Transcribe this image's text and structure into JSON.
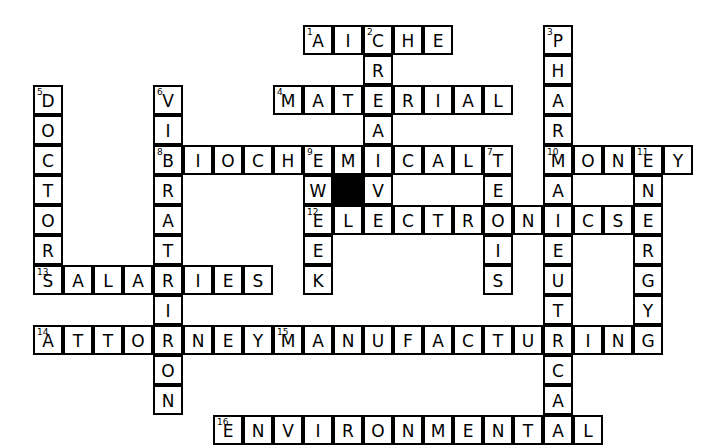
{
  "puzzle": {
    "title": "Crossword Puzzle",
    "cell_size": 30,
    "origin_x": 33,
    "origin_y": 25,
    "grid_cols": 22,
    "grid_rows": 14,
    "colors": {
      "background": "#ffffff",
      "cell_fill": "#ffffff",
      "cell_border": "#000000",
      "block_fill": "#000000",
      "letter": "#000000"
    },
    "entries": [
      {
        "number": "1",
        "direction": "across",
        "answer": "AICHE",
        "row": 0,
        "col": 9
      },
      {
        "number": "2",
        "direction": "down",
        "answer": "CREATE",
        "row": 0,
        "col": 11
      },
      {
        "number": "3",
        "direction": "down",
        "answer": "PHARMACEUTICAL",
        "row": 0,
        "col": 17
      },
      {
        "number": "4",
        "direction": "across",
        "answer": "MATERIAL",
        "row": 2,
        "col": 8
      },
      {
        "number": "5",
        "direction": "down",
        "answer": "DOCTOR",
        "row": 2,
        "col": 0
      },
      {
        "number": "6",
        "direction": "down",
        "answer": "VIBRATIONS",
        "row": 2,
        "col": 4
      },
      {
        "number": "7",
        "direction": "down",
        "answer": "TENSIS",
        "row": 4,
        "col": 15
      },
      {
        "number": "8",
        "direction": "across",
        "answer": "BIOCHEMICAL",
        "row": 4,
        "col": 4
      },
      {
        "number": "9",
        "direction": "down",
        "answer": "EWEEK",
        "row": 4,
        "col": 9
      },
      {
        "number": "10",
        "direction": "across",
        "answer": "MONEY",
        "row": 4,
        "col": 17
      },
      {
        "number": "11",
        "direction": "down",
        "answer": "ENERGY",
        "row": 4,
        "col": 20
      },
      {
        "number": "12",
        "direction": "across",
        "answer": "ELECTRONICS",
        "row": 6,
        "col": 9
      },
      {
        "number": "13",
        "direction": "across",
        "answer": "SALARIES",
        "row": 8,
        "col": 0
      },
      {
        "number": "14",
        "direction": "across",
        "answer": "ATTORNEY",
        "row": 10,
        "col": 0
      },
      {
        "number": "15",
        "direction": "across",
        "answer": "MANUFACTURING",
        "row": 10,
        "col": 8
      },
      {
        "number": "16",
        "direction": "across",
        "answer": "ENVIRONMENTAL",
        "row": 13,
        "col": 6
      }
    ],
    "blocks": [
      {
        "row": 5,
        "col": 10
      }
    ],
    "cells": [
      {
        "row": 0,
        "col": 9,
        "letter": "A",
        "number": "1"
      },
      {
        "row": 0,
        "col": 10,
        "letter": "I",
        "number": ""
      },
      {
        "row": 0,
        "col": 11,
        "letter": "C",
        "number": "2"
      },
      {
        "row": 0,
        "col": 12,
        "letter": "H",
        "number": ""
      },
      {
        "row": 0,
        "col": 13,
        "letter": "E",
        "number": ""
      },
      {
        "row": 0,
        "col": 17,
        "letter": "P",
        "number": "3"
      },
      {
        "row": 1,
        "col": 11,
        "letter": "R",
        "number": ""
      },
      {
        "row": 1,
        "col": 17,
        "letter": "H",
        "number": ""
      },
      {
        "row": 2,
        "col": 0,
        "letter": "D",
        "number": "5"
      },
      {
        "row": 2,
        "col": 4,
        "letter": "V",
        "number": "6"
      },
      {
        "row": 2,
        "col": 8,
        "letter": "M",
        "number": "4"
      },
      {
        "row": 2,
        "col": 9,
        "letter": "A",
        "number": ""
      },
      {
        "row": 2,
        "col": 10,
        "letter": "T",
        "number": ""
      },
      {
        "row": 2,
        "col": 11,
        "letter": "E",
        "number": ""
      },
      {
        "row": 2,
        "col": 12,
        "letter": "R",
        "number": ""
      },
      {
        "row": 2,
        "col": 13,
        "letter": "I",
        "number": ""
      },
      {
        "row": 2,
        "col": 14,
        "letter": "A",
        "number": ""
      },
      {
        "row": 2,
        "col": 15,
        "letter": "L",
        "number": ""
      },
      {
        "row": 2,
        "col": 17,
        "letter": "A",
        "number": ""
      },
      {
        "row": 3,
        "col": 0,
        "letter": "O",
        "number": ""
      },
      {
        "row": 3,
        "col": 4,
        "letter": "I",
        "number": ""
      },
      {
        "row": 3,
        "col": 11,
        "letter": "A",
        "number": ""
      },
      {
        "row": 3,
        "col": 17,
        "letter": "R",
        "number": ""
      },
      {
        "row": 4,
        "col": 0,
        "letter": "C",
        "number": ""
      },
      {
        "row": 4,
        "col": 4,
        "letter": "B",
        "number": "8"
      },
      {
        "row": 4,
        "col": 5,
        "letter": "I",
        "number": ""
      },
      {
        "row": 4,
        "col": 6,
        "letter": "O",
        "number": ""
      },
      {
        "row": 4,
        "col": 7,
        "letter": "C",
        "number": ""
      },
      {
        "row": 4,
        "col": 8,
        "letter": "H",
        "number": ""
      },
      {
        "row": 4,
        "col": 9,
        "letter": "E",
        "number": "9"
      },
      {
        "row": 4,
        "col": 10,
        "letter": "M",
        "number": ""
      },
      {
        "row": 4,
        "col": 11,
        "letter": "I",
        "number": ""
      },
      {
        "row": 4,
        "col": 12,
        "letter": "C",
        "number": ""
      },
      {
        "row": 4,
        "col": 13,
        "letter": "A",
        "number": ""
      },
      {
        "row": 4,
        "col": 14,
        "letter": "L",
        "number": ""
      },
      {
        "row": 4,
        "col": 15,
        "letter": "T",
        "number": "7"
      },
      {
        "row": 4,
        "col": 17,
        "letter": "M",
        "number": "10"
      },
      {
        "row": 4,
        "col": 18,
        "letter": "O",
        "number": ""
      },
      {
        "row": 4,
        "col": 19,
        "letter": "N",
        "number": ""
      },
      {
        "row": 4,
        "col": 20,
        "letter": "E",
        "number": "11"
      },
      {
        "row": 4,
        "col": 21,
        "letter": "Y",
        "number": ""
      },
      {
        "row": 5,
        "col": 0,
        "letter": "T",
        "number": ""
      },
      {
        "row": 5,
        "col": 4,
        "letter": "R",
        "number": ""
      },
      {
        "row": 5,
        "col": 9,
        "letter": "W",
        "number": ""
      },
      {
        "row": 5,
        "col": 11,
        "letter": "V",
        "number": ""
      },
      {
        "row": 5,
        "col": 15,
        "letter": "E",
        "number": ""
      },
      {
        "row": 5,
        "col": 17,
        "letter": "A",
        "number": ""
      },
      {
        "row": 5,
        "col": 20,
        "letter": "N",
        "number": ""
      },
      {
        "row": 6,
        "col": 0,
        "letter": "O",
        "number": ""
      },
      {
        "row": 6,
        "col": 4,
        "letter": "A",
        "number": ""
      },
      {
        "row": 6,
        "col": 9,
        "letter": "E",
        "number": "12"
      },
      {
        "row": 6,
        "col": 10,
        "letter": "L",
        "number": ""
      },
      {
        "row": 6,
        "col": 11,
        "letter": "E",
        "number": ""
      },
      {
        "row": 6,
        "col": 12,
        "letter": "C",
        "number": ""
      },
      {
        "row": 6,
        "col": 13,
        "letter": "T",
        "number": ""
      },
      {
        "row": 6,
        "col": 14,
        "letter": "R",
        "number": ""
      },
      {
        "row": 6,
        "col": 15,
        "letter": "O",
        "number": ""
      },
      {
        "row": 6,
        "col": 16,
        "letter": "N",
        "number": ""
      },
      {
        "row": 6,
        "col": 17,
        "letter": "I",
        "number": ""
      },
      {
        "row": 6,
        "col": 18,
        "letter": "C",
        "number": ""
      },
      {
        "row": 6,
        "col": 19,
        "letter": "S",
        "number": ""
      },
      {
        "row": 6,
        "col": 20,
        "letter": "E",
        "number": ""
      },
      {
        "row": 7,
        "col": 0,
        "letter": "R",
        "number": ""
      },
      {
        "row": 7,
        "col": 4,
        "letter": "T",
        "number": ""
      },
      {
        "row": 7,
        "col": 9,
        "letter": "E",
        "number": ""
      },
      {
        "row": 7,
        "col": 15,
        "letter": "I",
        "number": ""
      },
      {
        "row": 7,
        "col": 17,
        "letter": "E",
        "number": ""
      },
      {
        "row": 7,
        "col": 20,
        "letter": "R",
        "number": ""
      },
      {
        "row": 8,
        "col": 0,
        "letter": "S",
        "number": "13"
      },
      {
        "row": 8,
        "col": 1,
        "letter": "A",
        "number": ""
      },
      {
        "row": 8,
        "col": 2,
        "letter": "L",
        "number": ""
      },
      {
        "row": 8,
        "col": 3,
        "letter": "A",
        "number": ""
      },
      {
        "row": 8,
        "col": 4,
        "letter": "R",
        "number": ""
      },
      {
        "row": 8,
        "col": 5,
        "letter": "I",
        "number": ""
      },
      {
        "row": 8,
        "col": 6,
        "letter": "E",
        "number": ""
      },
      {
        "row": 8,
        "col": 7,
        "letter": "S",
        "number": ""
      },
      {
        "row": 8,
        "col": 9,
        "letter": "K",
        "number": ""
      },
      {
        "row": 8,
        "col": 15,
        "letter": "S",
        "number": ""
      },
      {
        "row": 8,
        "col": 17,
        "letter": "U",
        "number": ""
      },
      {
        "row": 8,
        "col": 20,
        "letter": "G",
        "number": ""
      },
      {
        "row": 9,
        "col": 4,
        "letter": "I",
        "number": ""
      },
      {
        "row": 9,
        "col": 17,
        "letter": "T",
        "number": ""
      },
      {
        "row": 9,
        "col": 20,
        "letter": "Y",
        "number": ""
      },
      {
        "row": 10,
        "col": 0,
        "letter": "A",
        "number": "14"
      },
      {
        "row": 10,
        "col": 1,
        "letter": "T",
        "number": ""
      },
      {
        "row": 10,
        "col": 2,
        "letter": "T",
        "number": ""
      },
      {
        "row": 10,
        "col": 3,
        "letter": "O",
        "number": ""
      },
      {
        "row": 10,
        "col": 4,
        "letter": "R",
        "number": ""
      },
      {
        "row": 10,
        "col": 5,
        "letter": "N",
        "number": ""
      },
      {
        "row": 10,
        "col": 6,
        "letter": "E",
        "number": ""
      },
      {
        "row": 10,
        "col": 7,
        "letter": "Y",
        "number": ""
      },
      {
        "row": 10,
        "col": 8,
        "letter": "M",
        "number": "15"
      },
      {
        "row": 10,
        "col": 9,
        "letter": "A",
        "number": ""
      },
      {
        "row": 10,
        "col": 10,
        "letter": "N",
        "number": ""
      },
      {
        "row": 10,
        "col": 11,
        "letter": "U",
        "number": ""
      },
      {
        "row": 10,
        "col": 12,
        "letter": "F",
        "number": ""
      },
      {
        "row": 10,
        "col": 13,
        "letter": "A",
        "number": ""
      },
      {
        "row": 10,
        "col": 14,
        "letter": "C",
        "number": ""
      },
      {
        "row": 10,
        "col": 15,
        "letter": "T",
        "number": ""
      },
      {
        "row": 10,
        "col": 16,
        "letter": "U",
        "number": ""
      },
      {
        "row": 10,
        "col": 17,
        "letter": "R",
        "number": ""
      },
      {
        "row": 10,
        "col": 18,
        "letter": "I",
        "number": ""
      },
      {
        "row": 10,
        "col": 19,
        "letter": "N",
        "number": ""
      },
      {
        "row": 10,
        "col": 20,
        "letter": "G",
        "number": ""
      },
      {
        "row": 11,
        "col": 4,
        "letter": "O",
        "number": ""
      },
      {
        "row": 11,
        "col": 17,
        "letter": "C",
        "number": ""
      },
      {
        "row": 12,
        "col": 4,
        "letter": "N",
        "number": ""
      },
      {
        "row": 12,
        "col": 17,
        "letter": "A",
        "number": ""
      },
      {
        "row": 13,
        "col": 6,
        "letter": "E",
        "number": "16"
      },
      {
        "row": 13,
        "col": 7,
        "letter": "N",
        "number": ""
      },
      {
        "row": 13,
        "col": 8,
        "letter": "V",
        "number": ""
      },
      {
        "row": 13,
        "col": 9,
        "letter": "I",
        "number": ""
      },
      {
        "row": 13,
        "col": 10,
        "letter": "R",
        "number": ""
      },
      {
        "row": 13,
        "col": 11,
        "letter": "O",
        "number": ""
      },
      {
        "row": 13,
        "col": 12,
        "letter": "N",
        "number": ""
      },
      {
        "row": 13,
        "col": 13,
        "letter": "M",
        "number": ""
      },
      {
        "row": 13,
        "col": 14,
        "letter": "E",
        "number": ""
      },
      {
        "row": 13,
        "col": 15,
        "letter": "N",
        "number": ""
      },
      {
        "row": 13,
        "col": 16,
        "letter": "T",
        "number": ""
      },
      {
        "row": 13,
        "col": 17,
        "letter": "A",
        "number": ""
      },
      {
        "row": 13,
        "col": 18,
        "letter": "L",
        "number": ""
      }
    ]
  }
}
